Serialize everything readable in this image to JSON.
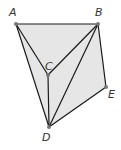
{
  "diagram": {
    "fill_color": "#e6e6e6",
    "line_color": "#1a1a1a",
    "point_color": "#777777",
    "points": {
      "A": {
        "label": "A",
        "x": 16,
        "y": 24,
        "lx": 9,
        "ly": 16
      },
      "B": {
        "label": "B",
        "x": 98,
        "y": 24,
        "lx": 95,
        "ly": 16
      },
      "C": {
        "label": "C",
        "x": 48,
        "y": 75,
        "lx": 45,
        "ly": 70
      },
      "D": {
        "label": "D",
        "x": 49,
        "y": 127,
        "lx": 42,
        "ly": 141
      },
      "E": {
        "label": "E",
        "x": 106,
        "y": 87,
        "lx": 108,
        "ly": 98
      }
    },
    "segments": [
      [
        "A",
        "B"
      ],
      [
        "A",
        "C"
      ],
      [
        "A",
        "D"
      ],
      [
        "B",
        "C"
      ],
      [
        "B",
        "D"
      ],
      [
        "B",
        "E"
      ],
      [
        "C",
        "D"
      ],
      [
        "D",
        "E"
      ]
    ],
    "shaded_polygon": [
      "A",
      "B",
      "E",
      "D"
    ]
  }
}
